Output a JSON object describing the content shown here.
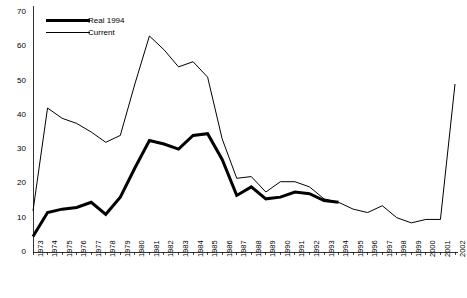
{
  "chart_data": {
    "type": "line",
    "title": "",
    "subtitle": "",
    "xlabel": "",
    "ylabel": "",
    "xlim": [
      1973,
      2002
    ],
    "ylim": [
      0,
      70
    ],
    "yticks": [
      0,
      10,
      20,
      30,
      40,
      50,
      60,
      70
    ],
    "grid": false,
    "legend_position": "top-left",
    "x": [
      1973,
      1974,
      1975,
      1976,
      1977,
      1978,
      1979,
      1980,
      1981,
      1982,
      1983,
      1984,
      1985,
      1986,
      1987,
      1988,
      1989,
      1990,
      1991,
      1992,
      1993,
      1994,
      1995,
      1996,
      1997,
      1998,
      1999,
      2000,
      2001,
      2002
    ],
    "categories": [
      "1973",
      "1974",
      "1975",
      "1976",
      "1977",
      "1978",
      "1979",
      "1980",
      "1981",
      "1982",
      "1983",
      "1984",
      "1985",
      "1986",
      "1987",
      "1988",
      "1989",
      "1990",
      "1991",
      "1992",
      "1993",
      "1994",
      "1995",
      "1996",
      "1997",
      "1998",
      "1999",
      "2000",
      "2001",
      "2002"
    ],
    "series": [
      {
        "name": "Real 1994",
        "style": "thick",
        "color": "#000000",
        "linewidth": 3,
        "values": [
          4.5,
          11.5,
          12.5,
          13,
          14.5,
          11,
          16,
          24.5,
          32.5,
          31.5,
          30,
          34,
          34.5,
          27,
          16.5,
          19,
          15.5,
          16,
          17.5,
          17,
          15,
          14.5,
          null,
          null,
          null,
          null,
          null,
          null,
          null,
          null
        ]
      },
      {
        "name": "Current",
        "style": "thin",
        "color": "#000000",
        "linewidth": 1,
        "values": [
          12,
          42,
          39,
          37.5,
          35,
          32,
          34,
          49,
          63,
          59,
          54,
          55.5,
          51,
          33,
          21.5,
          22,
          17.5,
          20.5,
          20.5,
          19,
          15.5,
          14.5,
          12.5,
          11.5,
          13.5,
          10,
          8.5,
          9.5,
          9.5,
          49
        ]
      }
    ]
  },
  "legend": {
    "items": [
      {
        "label": "Real 1994",
        "swatch": "thick-line-swatch"
      },
      {
        "label": "Current",
        "swatch": "thin-line-swatch"
      }
    ]
  },
  "axes": {
    "y_tick_labels": [
      "70",
      "60",
      "50",
      "40",
      "30",
      "20",
      "10",
      "0"
    ],
    "x_tick_labels": [
      "1973",
      "1974",
      "1975",
      "1976",
      "1977",
      "1978",
      "1979",
      "1980",
      "1981",
      "1982",
      "1983",
      "1984",
      "1985",
      "1986",
      "1987",
      "1988",
      "1989",
      "1990",
      "1991",
      "1992",
      "1993",
      "1994",
      "1995",
      "1996",
      "1997",
      "1998",
      "1999",
      "2000",
      "2001",
      "2002"
    ]
  },
  "colors": {
    "axis": "#000000",
    "series_primary": "#000000",
    "background": "#ffffff"
  }
}
